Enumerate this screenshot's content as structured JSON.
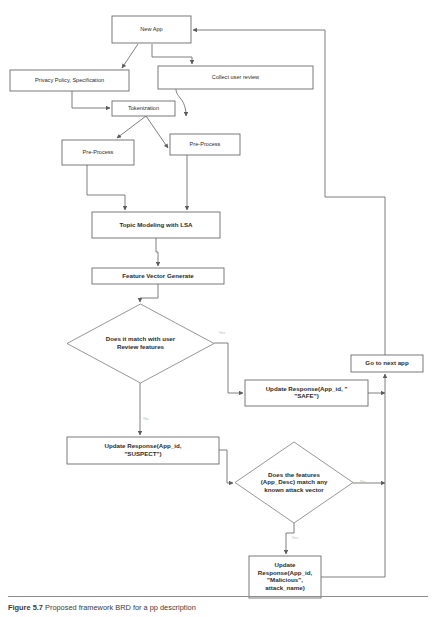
{
  "figure": {
    "caption_label": "Figure 5.7",
    "caption_text": "Proposed framework BRD for a pp description",
    "rule_color": "#8d8d8d"
  },
  "diagram": {
    "type": "flowchart",
    "colors": {
      "box_stroke": "#6b6b6b",
      "diamond_stroke": "#8a8a8a",
      "edge_stroke": "#6f6f6f",
      "text": "#2b2b2b",
      "edge_label": "#b9b9b9",
      "background": "#ffffff"
    },
    "nodes": [
      {
        "id": "new-app",
        "label": "New App",
        "shape": "rect",
        "x": 112,
        "y": 16,
        "w": 79,
        "h": 27,
        "lines": [
          "New App"
        ],
        "bold": false
      },
      {
        "id": "privacy-policy",
        "label": "Privacy Policy, Specification",
        "shape": "rect",
        "x": 10,
        "y": 70,
        "w": 119,
        "h": 21,
        "lines": [
          "Privacy Policy, Specification"
        ],
        "bold": false
      },
      {
        "id": "collect-user-review",
        "label": "Collect user review",
        "shape": "rect",
        "x": 158,
        "y": 66,
        "w": 155,
        "h": 23,
        "lines": [
          "Collect user review"
        ],
        "bold": false
      },
      {
        "id": "tokenization",
        "label": "Tokenization",
        "shape": "rect",
        "x": 112,
        "y": 101,
        "w": 63,
        "h": 15,
        "lines": [
          "Tokenization"
        ],
        "bold": false
      },
      {
        "id": "pre-process-left",
        "label": "Pre-Process",
        "shape": "rect",
        "x": 62,
        "y": 140,
        "w": 72,
        "h": 25,
        "lines": [
          "Pre-Process"
        ],
        "bold": false
      },
      {
        "id": "pre-process-right",
        "label": "Pre-Process",
        "shape": "rect",
        "x": 170,
        "y": 134,
        "w": 70,
        "h": 21,
        "lines": [
          "Pre-Process"
        ],
        "bold": false
      },
      {
        "id": "topic-modeling",
        "label": "Topic Modeling with LSA",
        "shape": "rect",
        "x": 92,
        "y": 212,
        "w": 128,
        "h": 26,
        "lines": [
          "Topic Modeling with LSA"
        ],
        "bold": true
      },
      {
        "id": "feature-vector",
        "label": "Feature Vector Generate",
        "shape": "rect",
        "x": 92,
        "y": 268,
        "w": 132,
        "h": 16,
        "lines": [
          "Feature Vector Generate"
        ],
        "bold": true
      },
      {
        "id": "decision-user-review",
        "label": "Does it match with user Review features",
        "shape": "diamond",
        "x": 67,
        "y": 304,
        "w": 147,
        "h": 79,
        "lines": [
          "Does it match with user",
          "Review features"
        ],
        "bold": true
      },
      {
        "id": "update-safe",
        "label": "Update Response(App_id, \"SAFE\")",
        "shape": "rect",
        "x": 245,
        "y": 380,
        "w": 123,
        "h": 26,
        "lines": [
          "Update Response(App_id, \"",
          "\"SAFE\")"
        ],
        "bold": true
      },
      {
        "id": "go-to-next-app",
        "label": "Go to next app",
        "shape": "rect",
        "x": 351,
        "y": 355,
        "w": 72,
        "h": 17,
        "lines": [
          "Go to next app"
        ],
        "bold": true
      },
      {
        "id": "update-suspect",
        "label": "Update Response(App_id, \"SUSPECT\")",
        "shape": "rect",
        "x": 67,
        "y": 437,
        "w": 152,
        "h": 27,
        "lines": [
          "Update Response(App_id,",
          "\"SUSPECT\")"
        ],
        "bold": true
      },
      {
        "id": "decision-attack-vector",
        "label": "Does the features (App_Desc) match any known attack vector",
        "shape": "diamond",
        "x": 235,
        "y": 442,
        "w": 118,
        "h": 81,
        "lines": [
          "Does the features",
          "(App_Desc) match any",
          "known attack vector"
        ],
        "bold": true
      },
      {
        "id": "update-malicious",
        "label": "Update Response(App_id, \"Malicious\", attack_name)",
        "shape": "rect",
        "x": 249,
        "y": 556,
        "w": 72,
        "h": 42,
        "lines": [
          "Update",
          "Response(App_id,",
          "\"Malicious\",",
          "attack_name)"
        ],
        "bold": true
      }
    ],
    "edge_labels": [
      {
        "id": "label-yes-review",
        "text": "Yes",
        "x": 222,
        "y": 333
      },
      {
        "id": "label-no-review",
        "text": "No",
        "x": 146,
        "y": 419
      },
      {
        "id": "label-no-attack",
        "text": "No",
        "x": 363,
        "y": 482
      },
      {
        "id": "label-yes-attack",
        "text": "Yes",
        "x": 295,
        "y": 538
      }
    ],
    "edges": [
      {
        "id": "edge-newapp-to-privacy",
        "from": "new-app",
        "to": "privacy-policy",
        "d": "M 138 44 L 122 68",
        "arrow": "end"
      },
      {
        "id": "edge-newapp-to-collect",
        "from": "new-app",
        "to": "collect-user-review",
        "d": "M 152 44 L 152 57 L 192 57 L 192 64",
        "arrow": "end"
      },
      {
        "id": "edge-privacy-to-tokenization",
        "from": "privacy-policy",
        "to": "tokenization",
        "d": "M 72 91 L 72 108 L 110 108",
        "arrow": "end"
      },
      {
        "id": "edge-collect-to-tokenization",
        "from": "collect-user-review",
        "to": "tokenization",
        "d": "M 176 89 C 176 98 186 98 186 116",
        "arrow": "end"
      },
      {
        "id": "edge-tokenization-to-preprocess-left",
        "from": "tokenization",
        "to": "pre-process-left",
        "d": "M 146 116 L 117 138",
        "arrow": "end"
      },
      {
        "id": "edge-tokenization-to-preprocess-right",
        "from": "tokenization",
        "to": "pre-process-right",
        "d": "M 146 116 L 168 148",
        "arrow": "end"
      },
      {
        "id": "edge-preprocess-left-to-topic",
        "from": "pre-process-left",
        "to": "topic-modeling",
        "d": "M 87 165 L 87 195 L 125 195 L 125 210",
        "arrow": "end"
      },
      {
        "id": "edge-preprocess-right-to-topic",
        "from": "pre-process-right",
        "to": "topic-modeling",
        "d": "M 187 155 L 187 210",
        "arrow": "end"
      },
      {
        "id": "edge-topic-to-feature",
        "from": "topic-modeling",
        "to": "feature-vector",
        "d": "M 156 238 L 156 252 L 158 252 L 158 266",
        "arrow": "end"
      },
      {
        "id": "edge-feature-to-decision-review",
        "from": "feature-vector",
        "to": "decision-user-review",
        "d": "M 158 284 L 158 298 L 140 298 L 140 302",
        "arrow": "end"
      },
      {
        "id": "edge-decision-review-yes-to-safe",
        "from": "decision-user-review",
        "to": "update-safe",
        "d": "M 214 343 L 228 343 L 228 393 L 243 393",
        "arrow": "end"
      },
      {
        "id": "edge-decision-review-no-to-suspect",
        "from": "decision-user-review",
        "to": "update-suspect",
        "d": "M 140 383 L 140 435",
        "arrow": "end"
      },
      {
        "id": "edge-safe-to-right-bus",
        "from": "update-safe",
        "to": "go-to-next-app",
        "d": "M 368 393 L 385 393",
        "arrow": "end"
      },
      {
        "id": "edge-suspect-to-decision-attack",
        "from": "update-suspect",
        "to": "decision-attack-vector",
        "d": "M 219 450 L 227 450 L 227 483 L 233 483",
        "arrow": "end"
      },
      {
        "id": "edge-decision-attack-no-to-bus",
        "from": "decision-attack-vector",
        "to": "go-to-next-app",
        "d": "M 353 483 L 385 483",
        "arrow": "end"
      },
      {
        "id": "edge-decision-attack-yes-to-malicious",
        "from": "decision-attack-vector",
        "to": "update-malicious",
        "d": "M 294 523 L 294 533 L 286 533 L 286 554",
        "arrow": "end"
      },
      {
        "id": "edge-malicious-to-bus",
        "from": "update-malicious",
        "to": "go-to-next-app",
        "d": "M 321 577 L 385 577",
        "arrow": "none"
      },
      {
        "id": "edge-bus-to-go-to-next-app",
        "from": "right-bus",
        "to": "go-to-next-app",
        "d": "M 385 577 L 385 374",
        "arrow": "end"
      },
      {
        "id": "edge-go-to-next-app-to-new-app",
        "from": "go-to-next-app",
        "to": "new-app",
        "d": "M 385 355 L 385 197 L 325 197 L 325 30 L 193 30",
        "arrow": "end"
      }
    ]
  }
}
